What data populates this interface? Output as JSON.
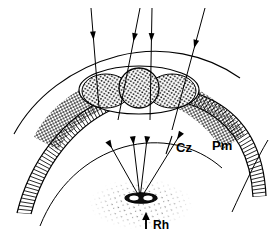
{
  "figure": {
    "background_color": "#ffffff",
    "ink_color": "#000000",
    "width": 278,
    "height": 236
  },
  "labels": [
    {
      "id": "cz",
      "text": "Cz",
      "meaning": "clear zone",
      "x": 176,
      "y": 147,
      "font_size": 13
    },
    {
      "id": "pm",
      "text": "Pm",
      "meaning": "pigment / photoreceptor membrane layer",
      "x": 212,
      "y": 145,
      "font_size": 13
    },
    {
      "id": "rh",
      "text": "Rh",
      "meaning": "rhabdom",
      "x": 155,
      "y": 225,
      "font_size": 12
    }
  ],
  "incident_arrows": {
    "count": 4,
    "description": "Four incident light rays entering from the top, pointing downward toward the facet surface",
    "rays": [
      {
        "id": "ray-1",
        "x1": 91,
        "y1": 8,
        "x2": 99,
        "y2": 108,
        "head_at": 0.32,
        "tilt": "near-vertical"
      },
      {
        "id": "ray-2",
        "x1": 140,
        "y1": 8,
        "x2": 118,
        "y2": 120,
        "head_at": 0.3,
        "tilt": "tilted-left"
      },
      {
        "id": "ray-3",
        "x1": 152,
        "y1": 8,
        "x2": 150,
        "y2": 120,
        "head_at": 0.3,
        "tilt": "vertical"
      },
      {
        "id": "ray-4",
        "x1": 205,
        "y1": 8,
        "x2": 172,
        "y2": 130,
        "head_at": 0.33,
        "tilt": "tilted-left-strong"
      }
    ]
  },
  "convergent_rays": {
    "count": 4,
    "description": "Rays converging from the rhabdom source upward into the membrane band",
    "source": {
      "x": 140,
      "y": 198
    },
    "rays": [
      {
        "id": "conv-1",
        "x1": 140,
        "y1": 198,
        "x2": 109,
        "y2": 143
      },
      {
        "id": "conv-2",
        "x1": 140,
        "y1": 198,
        "x2": 133,
        "y2": 139
      },
      {
        "id": "conv-3",
        "x1": 140,
        "y1": 198,
        "x2": 147,
        "y2": 139
      },
      {
        "id": "conv-4",
        "x1": 141,
        "y1": 198,
        "x2": 181,
        "y2": 133
      }
    ]
  },
  "rhabdom_source": {
    "id": "rh-source",
    "shape": "small dark ellipse",
    "cx": 141,
    "cy": 198,
    "rx": 16,
    "ry": 5,
    "halo": "sparse stippled scatter surrounding the source"
  },
  "rh_marker_arrow": {
    "description": "Short upward arrow immediately left of the Rh label",
    "x": 146,
    "y_tail": 228,
    "y_head": 214
  },
  "facet_ellipse": {
    "id": "facet-ellipse",
    "description": "Large outer ellipse at the top of the arc containing three stippled lobes",
    "cx": 139,
    "cy": 90,
    "rx": 60,
    "ry": 24
  },
  "lobes": [
    {
      "id": "lobe-left",
      "cx": 106,
      "cy": 91,
      "rx": 24,
      "ry": 17,
      "texture": "stipple"
    },
    {
      "id": "lobe-center",
      "cx": 139,
      "cy": 88,
      "rx": 20,
      "ry": 20,
      "texture": "stipple"
    },
    {
      "id": "lobe-right",
      "cx": 172,
      "cy": 91,
      "rx": 24,
      "ry": 17,
      "texture": "stipple"
    }
  ],
  "stipple_regions": [
    {
      "id": "stipple-left-flank",
      "description": "Dense crosshatch stipple on left flank of the arc"
    },
    {
      "id": "stipple-right-flank",
      "description": "Dense crosshatch stipple on right flank of the arc"
    }
  ],
  "hatched_band": {
    "id": "pm-band",
    "description": "Curved band with fine perpendicular hatch marks spanning the arc (Pm layer)",
    "hatch_count": 96,
    "thickness": 13
  },
  "arcs": [
    {
      "id": "outer-arc",
      "description": "Outermost thin curved boundary of the eye surface"
    },
    {
      "id": "mid-arc",
      "description": "Arc just outside the hatched band"
    },
    {
      "id": "inner-arc",
      "description": "Inner curved boundary below the hatched band (clear zone boundary)"
    },
    {
      "id": "deep-arc",
      "description": "Deepest arc passing behind the rhabdom region"
    }
  ]
}
